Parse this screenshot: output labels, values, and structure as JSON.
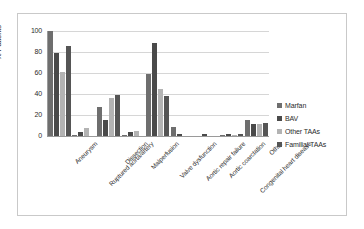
{
  "chart_data": {
    "type": "bar",
    "title": "",
    "subtitle": "",
    "xlabel": "",
    "ylabel": "% Patients",
    "ylim": [
      0,
      100
    ],
    "yticks": [
      "0",
      "20",
      "40",
      "60",
      "80",
      "100"
    ],
    "grid": true,
    "legend_position": "right",
    "categories": [
      "Aneurysm",
      "Ruptured aorta/artery",
      "Dissection",
      "Malperfusion",
      "Valve dysfunction",
      "Aortic repair failure",
      "Aortic coarctation",
      "Congenital heart disease",
      "Other"
    ],
    "series": [
      {
        "name": "Marfan",
        "color": "#6e6e6e",
        "values": [
          100,
          1,
          28,
          1,
          59,
          9,
          0,
          1,
          15
        ]
      },
      {
        "name": "BAV",
        "color": "#4a4a4a",
        "values": [
          79,
          4,
          15,
          4,
          89,
          2,
          2,
          2,
          11
        ]
      },
      {
        "name": "Other TAAs",
        "color": "#b3b3b3",
        "values": [
          61,
          8,
          36,
          5,
          45,
          0,
          0,
          1,
          11
        ]
      },
      {
        "name": "Familial TAAs",
        "color": "#555555",
        "values": [
          86,
          0,
          39,
          0,
          38,
          0,
          0,
          2,
          12
        ]
      }
    ]
  },
  "legend": {
    "items": [
      {
        "label": "Marfan",
        "color": "#6e6e6e"
      },
      {
        "label": "BAV",
        "color": "#4a4a4a"
      },
      {
        "label": "Other TAAs",
        "color": "#b3b3b3"
      },
      {
        "label": "Familial TAAs",
        "color": "#555555"
      }
    ]
  },
  "axes": {
    "y_title": "% Patients",
    "y_ticks": [
      "100",
      "80",
      "60",
      "40",
      "20",
      "0"
    ]
  }
}
